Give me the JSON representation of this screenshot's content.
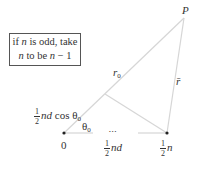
{
  "note": {
    "line1_pre": "if ",
    "line1_var": "n",
    "line1_post": " is odd, take",
    "line2_var1": "n",
    "line2_mid": " to be ",
    "line2_var2": "n",
    "line2_post": " − 1"
  },
  "labels": {
    "P": "P",
    "r0": "r",
    "r0_sub": "0",
    "rbar": "r̄",
    "proj_num": "1",
    "proj_den": "2",
    "proj_var": "nd",
    "proj_cos": " cos θ",
    "proj_sub": "0",
    "theta": "θ",
    "theta_sub": "0",
    "origin": "0",
    "ellipsis": "•••",
    "mid_num": "1",
    "mid_den": "2",
    "mid_var": "nd",
    "end_num": "1",
    "end_den": "2",
    "end_var": "n"
  },
  "colors": {
    "line": "#d8d8d8",
    "dot": "#222222"
  }
}
